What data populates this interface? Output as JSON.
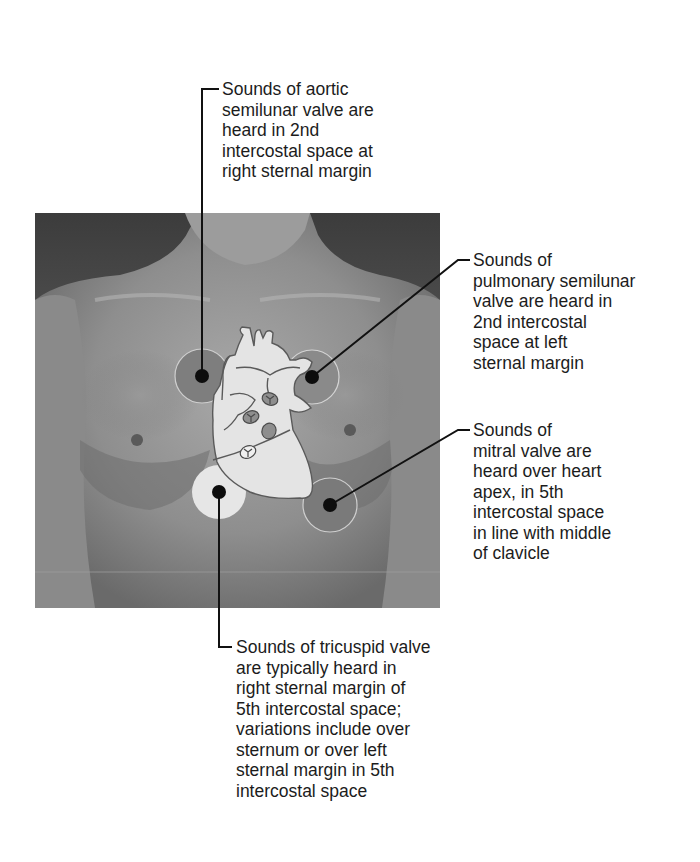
{
  "figure": {
    "colors": {
      "background": "#ffffff",
      "photo_dark": "#3a3a3a",
      "skin_mid": "#8c8c8c",
      "heart_fill": "#e6e6e6",
      "heart_outline": "#5a5a5a",
      "zone_dark": "#808080",
      "zone_light": "#e4e4e4",
      "leader_line": "#111111"
    },
    "labels": {
      "aortic": "Sounds of aortic\nsemilunar valve are\nheard in 2nd\nintercostal space at\nright sternal margin",
      "pulmonary": "Sounds of\npulmonary semilunar\nvalve are heard in\n2nd intercostal\nspace at left\nsternal margin",
      "mitral": "Sounds of\nmitral valve are\nheard over heart\napex, in 5th\nintercostal space\nin line with middle\nof clavicle",
      "tricuspid": "Sounds of tricuspid valve\nare typically heard in\nright sternal margin of\n5th intercostal space;\nvariations include over\nsternum or over left\nsternal margin in 5th\nintercostal space"
    },
    "auscultation_sites": [
      {
        "id": "aortic",
        "side": "right sternal margin",
        "intercostal_space": "2nd"
      },
      {
        "id": "pulmonary",
        "side": "left sternal margin",
        "intercostal_space": "2nd"
      },
      {
        "id": "mitral",
        "side": "heart apex, midclavicular line",
        "intercostal_space": "5th"
      },
      {
        "id": "tricuspid",
        "side": "right sternal margin",
        "intercostal_space": "5th"
      }
    ]
  }
}
